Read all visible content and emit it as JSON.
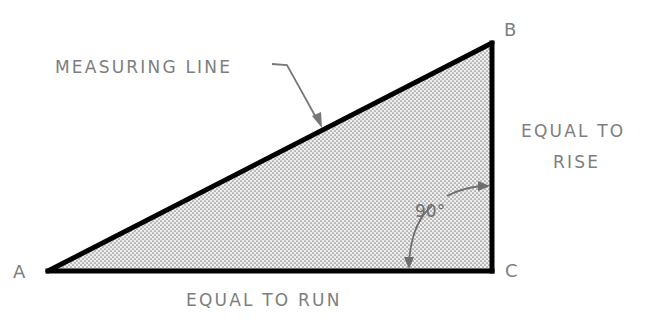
{
  "diagram": {
    "vertices": {
      "A": {
        "label": "A",
        "x": 48,
        "y": 271
      },
      "B": {
        "label": "B",
        "x": 492,
        "y": 43
      },
      "C": {
        "label": "C",
        "x": 492,
        "y": 271
      }
    },
    "labels": {
      "measuring_line": "MEASURING LINE",
      "rise_line1": "EQUAL TO",
      "rise_line2": "RISE",
      "run": "EQUAL TO RUN",
      "angle": "90°"
    },
    "colors": {
      "outline": "#000000",
      "fill_dots": "#8a8a8a",
      "fill_background": "#eeeeee",
      "text": "#7e7e7e",
      "annotation": "#777777"
    },
    "fill_pattern": "stipple-dots"
  }
}
